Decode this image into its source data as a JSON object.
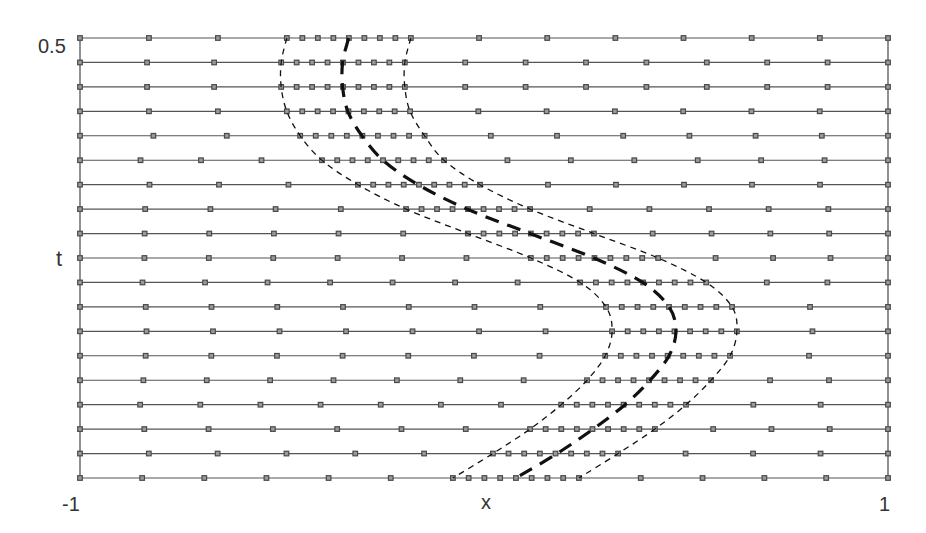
{
  "chart_data": {
    "type": "line",
    "title": "",
    "xlabel": "x",
    "ylabel": "t",
    "xlim": [
      -1,
      1
    ],
    "ylim": [
      0,
      0.5
    ],
    "x_tick_labels": [
      "-1",
      "1"
    ],
    "y_tick_labels": [
      "0.5"
    ],
    "grid": false,
    "legend": null,
    "num_time_levels": 19,
    "series": [
      {
        "name": "front-center",
        "style": "thick-dashed",
        "t": [
          0.5,
          0.4722,
          0.4444,
          0.4167,
          0.3889,
          0.3611,
          0.3333,
          0.3056,
          0.2778,
          0.25,
          0.2222,
          0.1944,
          0.1667,
          0.1389,
          0.1111,
          0.0833,
          0.0556,
          0.0278,
          0.0
        ],
        "x": [
          -0.335,
          -0.35,
          -0.35,
          -0.337,
          -0.302,
          -0.25,
          -0.163,
          -0.042,
          0.114,
          0.272,
          0.393,
          0.458,
          0.475,
          0.458,
          0.411,
          0.349,
          0.27,
          0.181,
          0.079
        ]
      },
      {
        "name": "band-left",
        "style": "thin-dashed",
        "t": [
          0.5,
          0.4722,
          0.4444,
          0.4167,
          0.3889,
          0.3611,
          0.3333,
          0.3056,
          0.2778,
          0.25,
          0.2222,
          0.1944,
          0.1667,
          0.1389,
          0.1111,
          0.0833,
          0.0556,
          0.0278,
          0.0
        ],
        "x": [
          -0.488,
          -0.502,
          -0.502,
          -0.488,
          -0.455,
          -0.401,
          -0.312,
          -0.193,
          -0.04,
          0.116,
          0.238,
          0.302,
          0.317,
          0.3,
          0.255,
          0.191,
          0.114,
          0.022,
          -0.077
        ]
      },
      {
        "name": "band-right",
        "style": "thin-dashed",
        "t": [
          0.5,
          0.4722,
          0.4444,
          0.4167,
          0.3889,
          0.3611,
          0.3333,
          0.3056,
          0.2778,
          0.25,
          0.2222,
          0.1944,
          0.1667,
          0.1389,
          0.1111,
          0.0833,
          0.0556,
          0.0278,
          0.0
        ],
        "x": [
          -0.181,
          -0.196,
          -0.196,
          -0.183,
          -0.147,
          -0.099,
          -0.01,
          0.114,
          0.272,
          0.431,
          0.55,
          0.614,
          0.626,
          0.609,
          0.562,
          0.5,
          0.423,
          0.332,
          0.235
        ]
      }
    ],
    "mesh": {
      "fine_intervals_in_band": 8,
      "coarse_spacing_px": 64
    }
  },
  "labels": {
    "y_top": "0.5",
    "y_axis": "t",
    "x_left": "-1",
    "x_axis": "x",
    "x_right": "1"
  },
  "colors": {
    "mesh_line": "#555555",
    "marker": "#4a4a4a",
    "marker_fill": "#9a9a9a",
    "front": "#111111",
    "text": "#333333"
  }
}
